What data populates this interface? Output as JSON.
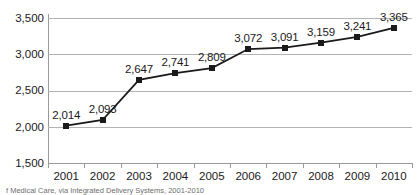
{
  "chart_data": {
    "type": "line",
    "title": "",
    "subtitle": "",
    "xlabel": "",
    "ylabel": "",
    "categories": [
      "2001",
      "2002",
      "2003",
      "2004",
      "2005",
      "2006",
      "2007",
      "2008",
      "2009",
      "2010"
    ],
    "values": [
      2014,
      2093,
      2647,
      2741,
      2809,
      3072,
      3091,
      3159,
      3241,
      3365
    ],
    "point_labels": [
      "2,014",
      "2,093",
      "2,647",
      "2,741",
      "2,809",
      "3,072",
      "3,091",
      "3,159",
      "3,241",
      "3,365"
    ],
    "series": [
      {
        "name": "",
        "values": [
          2014,
          2093,
          2647,
          2741,
          2809,
          3072,
          3091,
          3159,
          3241,
          3365
        ]
      }
    ],
    "ylim": [
      1500,
      3500
    ],
    "yticks": [
      1500,
      2000,
      2500,
      3000,
      3500
    ],
    "ytick_labels": [
      "1,500",
      "2,000",
      "2,500",
      "3,000",
      "3,500"
    ],
    "grid": true,
    "legend": "none",
    "marker": "square",
    "line_color": "#1a1a1a",
    "marker_color": "#1a1a1a",
    "grid_color": "#b3b3b3",
    "axis_color": "#9a9a9a",
    "background": "#ffffff"
  },
  "caption": {
    "text": "f Medical Care, via Integrated Delivery Systems, 2001-2010"
  }
}
